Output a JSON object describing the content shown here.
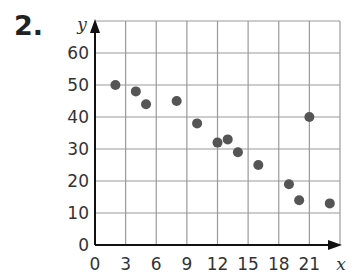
{
  "problem": {
    "number": "2."
  },
  "chart_data": {
    "type": "scatter",
    "title": "",
    "xlabel": "x",
    "ylabel": "y",
    "xlim": [
      0,
      24
    ],
    "ylim": [
      0,
      70
    ],
    "grid": true,
    "x_ticks": [
      0,
      3,
      6,
      9,
      12,
      15,
      18,
      21
    ],
    "y_ticks": [
      0,
      10,
      20,
      30,
      40,
      50,
      60
    ],
    "points": [
      {
        "x": 2,
        "y": 50
      },
      {
        "x": 4,
        "y": 48
      },
      {
        "x": 5,
        "y": 44
      },
      {
        "x": 8,
        "y": 45
      },
      {
        "x": 10,
        "y": 38
      },
      {
        "x": 12,
        "y": 32
      },
      {
        "x": 13,
        "y": 33
      },
      {
        "x": 14,
        "y": 29
      },
      {
        "x": 16,
        "y": 25
      },
      {
        "x": 19,
        "y": 19
      },
      {
        "x": 20,
        "y": 14
      },
      {
        "x": 21,
        "y": 40
      },
      {
        "x": 23,
        "y": 13
      }
    ],
    "colors": {
      "point": "#555555",
      "grid": "#9a9a9a",
      "axis": "#111111"
    }
  }
}
